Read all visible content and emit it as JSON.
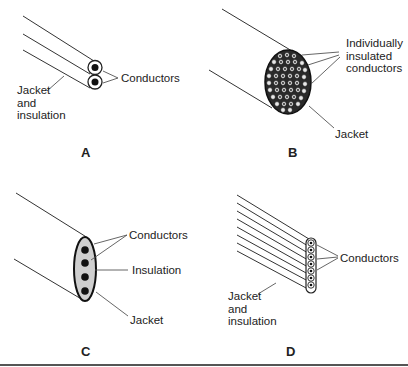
{
  "figure": {
    "panels": [
      {
        "id": "A",
        "label": "A",
        "callouts": {
          "conductors": "Conductors",
          "jacket_lines": [
            "Jacket",
            "and",
            "insulation"
          ]
        }
      },
      {
        "id": "B",
        "label": "B",
        "callouts": {
          "conductors_lines": [
            "Individually",
            "insulated",
            "conductors"
          ],
          "jacket": "Jacket"
        }
      },
      {
        "id": "C",
        "label": "C",
        "callouts": {
          "conductors": "Conductors",
          "insulation": "Insulation",
          "jacket": "Jacket"
        }
      },
      {
        "id": "D",
        "label": "D",
        "callouts": {
          "conductors": "Conductors",
          "jacket_lines": [
            "Jacket",
            "and",
            "insulation"
          ]
        }
      }
    ],
    "colors": {
      "line": "#333333",
      "conductor": "#111111",
      "insulation_fill": "#cfcfcf",
      "bottom_rule": "#555555"
    }
  }
}
